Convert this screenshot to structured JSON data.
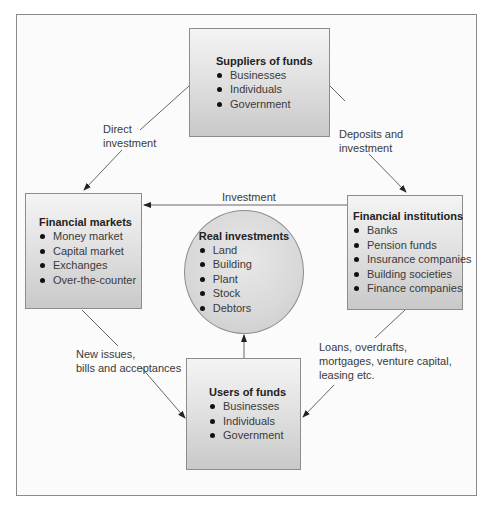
{
  "diagram": {
    "nodes": {
      "suppliers": {
        "title": "Suppliers of funds",
        "items": [
          "Businesses",
          "Individuals",
          "Government"
        ]
      },
      "markets": {
        "title": "Financial markets",
        "items": [
          "Money market",
          "Capital market",
          "Exchanges",
          "Over-the-counter"
        ]
      },
      "institutions": {
        "title": "Financial institutions",
        "items": [
          "Banks",
          "Pension funds",
          "Insurance companies",
          "Building societies",
          "Finance companies"
        ]
      },
      "real": {
        "title": "Real investments",
        "items": [
          "Land",
          "Building",
          "Plant",
          "Stock",
          "Debtors"
        ]
      },
      "users": {
        "title": "Users of funds",
        "items": [
          "Businesses",
          "Individuals",
          "Government"
        ]
      }
    },
    "edges": {
      "direct": {
        "line1": "Direct",
        "line2": "investment"
      },
      "deposits": {
        "line1": "Deposits and",
        "line2": "investment"
      },
      "investment": {
        "label": "Investment"
      },
      "new_issues": {
        "line1": "New issues,",
        "line2": "bills and acceptances"
      },
      "loans": {
        "line1": "Loans, overdrafts,",
        "line2": "mortgages, venture capital,",
        "line3": "leasing etc."
      }
    },
    "colors": {
      "line": "#555555",
      "frame": "#8a8a8a",
      "box_top": "#f4f4f4",
      "box_bottom": "#c9c9c9"
    }
  }
}
